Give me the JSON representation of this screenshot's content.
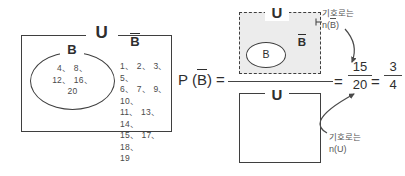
{
  "figure": {
    "title_text": "",
    "background_color": "#ffffff",
    "ink_color": "#3f3f3f",
    "shade_color": "#ececec"
  },
  "main_diagram": {
    "universe_label": "U",
    "set_label": "B",
    "complement_label": "B",
    "set_elements": "4、 8、\n12、 16、\n20",
    "complement_elements": "1、 2、 3、 5、\n6、 7、 9、 10、\n11、 13、 14、\n15、 17、 18、\n19",
    "set_elements_list": [
      4,
      8,
      12,
      16,
      20
    ],
    "complement_elements_list": [
      1,
      2,
      3,
      5,
      6,
      7,
      9,
      10,
      11,
      13,
      14,
      15,
      17,
      18,
      19
    ]
  },
  "expression": {
    "probability_label": "P (B) =",
    "probability_prefix": "P (",
    "probability_arg": "B",
    "probability_suffix": ") =",
    "equals_1": "=",
    "equals_2": "=",
    "fraction_1": {
      "numerator": "15",
      "denominator": "20"
    },
    "fraction_2": {
      "numerator": "3",
      "denominator": "4"
    }
  },
  "numerator_diagram": {
    "universe_label": "U",
    "set_label": "B",
    "complement_label": "B",
    "border_style": "dashed",
    "fill": "#ececec"
  },
  "denominator_diagram": {
    "universe_label": "U",
    "border_style": "solid",
    "fill": "#ffffff"
  },
  "annotations": {
    "numerator": {
      "line1": "기호로는",
      "line2_prefix": "n(",
      "line2_arg": "B",
      "line2_suffix": ")"
    },
    "denominator": {
      "line1": "기호로는",
      "line2": "n(U)"
    }
  }
}
